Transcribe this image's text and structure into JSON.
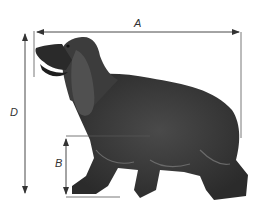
{
  "figure": {
    "background": "#ffffff",
    "line_color": "#555555",
    "dog_color": "#3a3a3a"
  },
  "dimensions": {
    "A": {
      "label": "A",
      "description": "Body length: nose tip to rear of hindquarters"
    },
    "B": {
      "label": "B",
      "description": "Height from ground to underside of chest"
    },
    "D": {
      "label": "D",
      "description": "Total height: ground to top of head/nose"
    }
  }
}
